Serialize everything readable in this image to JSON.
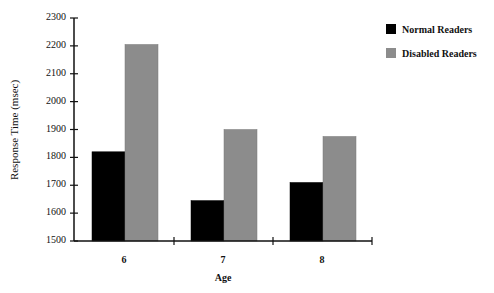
{
  "chart_data": {
    "type": "bar",
    "title": "",
    "xlabel": "Age",
    "ylabel": "Response Time (msec)",
    "categories": [
      "6",
      "7",
      "8"
    ],
    "series": [
      {
        "name": "Normal Readers",
        "color": "#000000",
        "values": [
          1820,
          1645,
          1710
        ]
      },
      {
        "name": "Disabled Readers",
        "color": "#8c8c8c",
        "values": [
          2205,
          1900,
          1875
        ]
      }
    ],
    "ylim": [
      1500,
      2300
    ],
    "yticks": [
      1500,
      1600,
      1700,
      1800,
      1900,
      2000,
      2100,
      2200,
      2300
    ],
    "grid": false,
    "legend_position": "top-right"
  },
  "legend": {
    "items": [
      {
        "label": "Normal Readers",
        "color": "#000000"
      },
      {
        "label": "Disabled Readers",
        "color": "#8c8c8c"
      }
    ]
  },
  "axes": {
    "x_title": "Age",
    "y_title": "Response Time (msec)",
    "x_categories": [
      "6",
      "7",
      "8"
    ],
    "y_tick_labels": [
      "2300",
      "2200",
      "2100",
      "2000",
      "1900",
      "1800",
      "1700",
      "1600",
      "1500"
    ]
  }
}
